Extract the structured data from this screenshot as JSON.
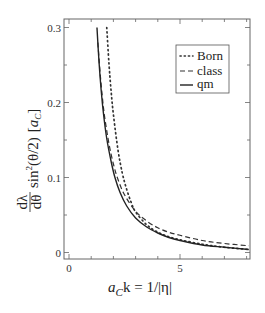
{
  "chart_data": {
    "type": "line",
    "title": "",
    "xlabel": "a_C k = 1/|η|",
    "ylabel": "dλ/dθ sin²(θ/2) [a_C]",
    "xlim": [
      -0.5,
      8.2
    ],
    "ylim": [
      -0.01,
      0.31
    ],
    "xticks": [
      0,
      5
    ],
    "yticks": [
      0,
      0.1,
      0.2,
      0.3
    ],
    "grid": false,
    "legend_position": "upper right",
    "series": [
      {
        "name": "Born",
        "style": "dotted",
        "x": [
          1.7,
          1.8,
          1.9,
          2.0,
          2.2,
          2.4,
          2.6,
          2.8,
          3.0,
          3.5,
          4.0,
          4.5,
          5.0,
          6.0,
          7.0,
          8.1
        ],
        "y": [
          0.3,
          0.252,
          0.214,
          0.184,
          0.138,
          0.106,
          0.084,
          0.067,
          0.054,
          0.037,
          0.027,
          0.021,
          0.017,
          0.011,
          0.007,
          0.004
        ]
      },
      {
        "name": "class",
        "style": "dashed",
        "x": [
          1.3,
          1.4,
          1.5,
          1.6,
          1.8,
          2.0,
          2.2,
          2.5,
          3.0,
          3.5,
          4.0,
          4.5,
          5.0,
          6.0,
          7.0,
          8.1
        ],
        "y": [
          0.28,
          0.24,
          0.208,
          0.182,
          0.145,
          0.118,
          0.098,
          0.077,
          0.055,
          0.042,
          0.033,
          0.027,
          0.023,
          0.016,
          0.012,
          0.009
        ]
      },
      {
        "name": "qm",
        "style": "solid",
        "x": [
          1.26,
          1.35,
          1.45,
          1.55,
          1.7,
          1.9,
          2.07,
          2.3,
          2.6,
          3.0,
          3.5,
          4.0,
          4.5,
          5.0,
          6.0,
          7.0,
          8.1
        ],
        "y": [
          0.3,
          0.255,
          0.216,
          0.186,
          0.152,
          0.121,
          0.1,
          0.08,
          0.062,
          0.046,
          0.034,
          0.026,
          0.02,
          0.016,
          0.01,
          0.007,
          0.004
        ]
      }
    ]
  },
  "axes": {
    "x_tick_labels": [
      "0",
      "5"
    ],
    "y_tick_labels": [
      "0",
      "0.1",
      "0.2",
      "0.3"
    ],
    "xlabel_parts": {
      "a": "a",
      "sub": "C",
      "rest": "k = 1/|η|"
    },
    "ylabel_parts": {
      "frac_num": "dλ",
      "frac_den": "dθ",
      "mid": "sin",
      "sup": "2",
      "arg": "(θ/2)",
      "unit_a": "a",
      "unit_sub": "C"
    }
  },
  "legend": {
    "items": [
      "Born",
      "class",
      "qm"
    ]
  }
}
